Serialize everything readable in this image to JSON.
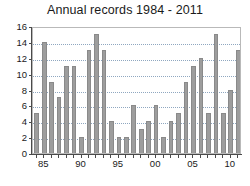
{
  "chart_data": {
    "type": "bar",
    "title": "Annual records 1984 - 2011",
    "xlabel": "",
    "ylabel": "",
    "ylim": [
      0,
      16
    ],
    "ytick_values": [
      0,
      2,
      4,
      6,
      8,
      10,
      12,
      14,
      16
    ],
    "ytick_labels": [
      "0",
      "2",
      "4",
      "6",
      "8",
      "10",
      "12",
      "14",
      "16"
    ],
    "grid": true,
    "grid_axis": "y",
    "legend": "none",
    "bar_color": "#9d9d9d",
    "bar_edge_color": "#8a8a8a",
    "grid_color": "#8fa7c0",
    "axis_color": "#4a4a4a",
    "categories": [
      "1984",
      "1985",
      "1986",
      "1987",
      "1988",
      "1989",
      "1990",
      "1991",
      "1992",
      "1993",
      "1994",
      "1995",
      "1996",
      "1997",
      "1998",
      "1999",
      "2000",
      "2001",
      "2002",
      "2003",
      "2004",
      "2005",
      "2006",
      "2007",
      "2008",
      "2009",
      "2010",
      "2011"
    ],
    "values": [
      5,
      14,
      9,
      7,
      11,
      11,
      2,
      13,
      15,
      13,
      4,
      2,
      2,
      6,
      3,
      4,
      6,
      2,
      4,
      5,
      9,
      11,
      12,
      5,
      15,
      5,
      8,
      13
    ],
    "xtick_labels": [
      "85",
      "90",
      "95",
      "00",
      "05",
      "10"
    ],
    "xtick_categories": [
      "1985",
      "1990",
      "1995",
      "2000",
      "2005",
      "2010"
    ]
  }
}
